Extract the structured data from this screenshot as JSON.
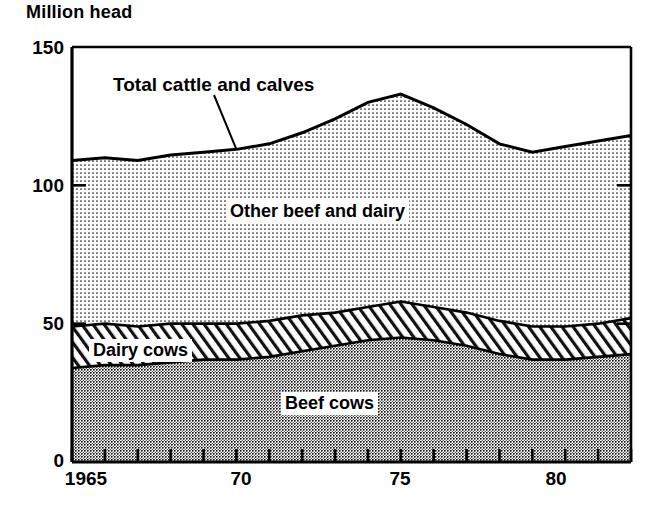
{
  "chart_data": {
    "type": "area",
    "title": "",
    "ylabel": "Million head",
    "xlabel": "",
    "ylim": [
      0,
      150
    ],
    "xlim": [
      1965,
      1982
    ],
    "grid": false,
    "legend_position": "inline-annotations",
    "stacked": true,
    "y_ticks": [
      0,
      50,
      100,
      150
    ],
    "y_tick_labels": [
      "0",
      "50",
      "100",
      "150"
    ],
    "x_ticks": [
      1965,
      1966,
      1967,
      1968,
      1969,
      1970,
      1971,
      1972,
      1973,
      1974,
      1975,
      1976,
      1977,
      1978,
      1979,
      1980,
      1981,
      1982
    ],
    "x_tick_labels": [
      "1965",
      "",
      "",
      "",
      "",
      "70",
      "",
      "",
      "",
      "",
      "75",
      "",
      "",
      "",
      "",
      "80",
      "",
      ""
    ],
    "x": [
      1965,
      1966,
      1967,
      1968,
      1969,
      1970,
      1971,
      1972,
      1973,
      1974,
      1975,
      1976,
      1977,
      1978,
      1979,
      1980,
      1981,
      1982
    ],
    "series": [
      {
        "name": "Beef cows",
        "label": "Beef cows",
        "fill": "dark-dot",
        "values": [
          34,
          35,
          35,
          36,
          37,
          37,
          38,
          40,
          42,
          44,
          45,
          44,
          42,
          39,
          37,
          37,
          38,
          39
        ]
      },
      {
        "name": "Dairy cows",
        "label": "Dairy cows",
        "fill": "diagonal-hatch",
        "values": [
          15,
          15,
          14,
          14,
          13,
          13,
          13,
          13,
          12,
          12,
          13,
          12,
          12,
          12,
          12,
          12,
          12,
          13
        ]
      },
      {
        "name": "Other beef and dairy",
        "label": "Other beef and dairy",
        "fill": "light-dot",
        "values": [
          60,
          60,
          60,
          61,
          62,
          63,
          64,
          66,
          70,
          74,
          75,
          72,
          68,
          64,
          63,
          65,
          66,
          66
        ]
      }
    ],
    "total_series": {
      "name": "Total cattle and calves",
      "label": "Total cattle and calves",
      "values": [
        109,
        110,
        109,
        111,
        112,
        113,
        115,
        119,
        124,
        130,
        133,
        128,
        122,
        115,
        112,
        114,
        116,
        118
      ]
    },
    "annotations": [
      {
        "text": "Total cattle and calves",
        "kind": "leader-line",
        "anchor_year": 1970
      },
      {
        "text": "Other beef and dairy",
        "kind": "inline"
      },
      {
        "text": "Dairy cows",
        "kind": "inline"
      },
      {
        "text": "Beef cows",
        "kind": "inline"
      }
    ]
  },
  "colors": {
    "ink": "#000000",
    "background": "#ffffff",
    "beef_cows_fill": "#9a9a9a",
    "other_beef_dairy_fill": "#d8d8d8",
    "dairy_cows_fill": "#ffffff"
  }
}
